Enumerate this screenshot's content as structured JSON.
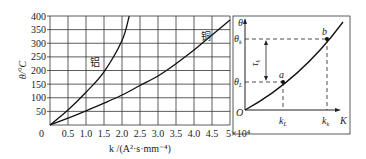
{
  "chart_data": [
    {
      "type": "line",
      "title": "",
      "xlabel": "k /(A²·s·mm⁻⁴)",
      "ylabel": "θ/°C",
      "x_multiplier_label": "×10⁴",
      "xlim": [
        0,
        5
      ],
      "ylim": [
        0,
        400
      ],
      "grid": true,
      "x_ticks": [
        "0",
        "0.5",
        "1.0",
        "1.5",
        "2.0",
        "2.5",
        "3.0",
        "3.5",
        "4.0",
        "4.5",
        "5×10⁴"
      ],
      "y_ticks": [
        "50",
        "100",
        "150",
        "200",
        "250",
        "300",
        "350",
        "400"
      ],
      "series": [
        {
          "name": "铝",
          "x": [
            0,
            0.5,
            1.0,
            1.5,
            2.0,
            2.2
          ],
          "y": [
            0,
            55,
            120,
            195,
            310,
            400
          ]
        },
        {
          "name": "铜",
          "x": [
            0,
            0.5,
            1.0,
            1.5,
            2.0,
            2.5,
            3.0,
            3.5,
            4.0,
            4.5,
            5.0
          ],
          "y": [
            0,
            25,
            52,
            80,
            110,
            145,
            180,
            225,
            275,
            330,
            385
          ]
        }
      ],
      "annotations": [
        {
          "text": "铝",
          "near_series": "铝"
        },
        {
          "text": "铜",
          "near_series": "铜"
        }
      ]
    },
    {
      "type": "line",
      "title": "",
      "xlabel": "K",
      "ylabel": "θ",
      "origin_label": "O",
      "grid": false,
      "points": [
        {
          "name": "a",
          "x_label": "k_L",
          "y_label": "θ_L"
        },
        {
          "name": "b",
          "x_label": "k_k",
          "y_label": "θ_k"
        }
      ],
      "interval_annotation": "τ_k",
      "labels": {
        "theta": "θ",
        "theta_k": "θ",
        "theta_k_sub": "k",
        "theta_L": "θ",
        "theta_L_sub": "L",
        "k_L": "k",
        "k_L_sub": "L",
        "k_k": "k",
        "k_k_sub": "k",
        "K": "K",
        "O": "O",
        "a": "a",
        "b": "b",
        "tau": "τ",
        "tau_sub": "k"
      }
    }
  ]
}
